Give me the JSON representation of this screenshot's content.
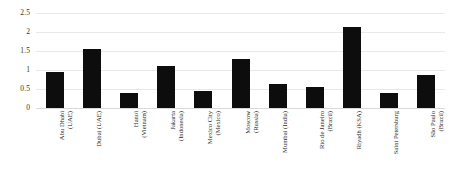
{
  "chart_data": {
    "type": "bar",
    "title": "",
    "subtitle": "",
    "xlabel": "",
    "ylabel": "",
    "categories": [
      "Abu Dhabi\n(UAE)",
      "Dubai (UAE)",
      "Hanoi\n(Vietnam)",
      "Jakarta\n(Indonesia)",
      "Mexico City\n(Mexico)",
      "Moscow\n(Russia)",
      "Mumbai (India)",
      "Rio de Janeiro\n(Brazil)",
      "Riyadh (KSA)",
      "Saint Petersburg",
      "São Paulo\n(Brazil)"
    ],
    "values": [
      0.95,
      1.55,
      0.4,
      1.1,
      0.45,
      1.3,
      0.62,
      0.54,
      2.12,
      0.4,
      0.88
    ],
    "ylim": [
      0,
      2.5
    ],
    "yticks": [
      0,
      0.5,
      1,
      1.5,
      2,
      2.5
    ],
    "ytick_labels": [
      "0",
      "0.5",
      "1",
      "1.5",
      "2",
      "2.5"
    ],
    "grid": true,
    "legend": false,
    "legend_position": "none",
    "bar_color": "#0d0d0d",
    "gridline_color": "#e8e8e8"
  }
}
